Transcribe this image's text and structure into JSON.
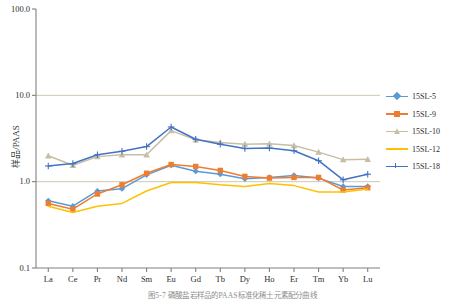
{
  "figure": {
    "caption": "图5-7 磷酸盐岩样品的PAAS标准化稀土元素配分曲线"
  },
  "axes": {
    "y_label": "样品/PAAS",
    "y_ticks": [
      "100.0",
      "10.0",
      "1.0",
      "0.1"
    ],
    "x_ticks": [
      "La",
      "Ce",
      "Pr",
      "Nd",
      "Sm",
      "Eu",
      "Gd",
      "Tb",
      "Dy",
      "Ho",
      "Er",
      "Tm",
      "Yb",
      "Lu"
    ]
  },
  "legend": {
    "items": [
      {
        "label": "15SL-5",
        "color": "#5B9BD5",
        "marker": "diamond"
      },
      {
        "label": "15SL-9",
        "color": "#ED7D31",
        "marker": "square"
      },
      {
        "label": "15SL-10",
        "color": "#C6BFA6",
        "marker": "triangle"
      },
      {
        "label": "15SL-12",
        "color": "#FFC000",
        "marker": "line"
      },
      {
        "label": "15SL-18",
        "color": "#4472C4",
        "marker": "plus"
      }
    ]
  },
  "colors": {
    "axis": "#808080",
    "gridline": "#C9C2A8",
    "plot_background": "#FFFFFF",
    "caption_text": "#8D8D8D"
  },
  "chart_data": {
    "type": "line",
    "title": "",
    "subtitle": "",
    "xlabel": "",
    "ylabel": "样品/PAAS",
    "yscale": "log",
    "ylim": [
      0.1,
      100.0
    ],
    "grid": true,
    "legend_position": "right",
    "categories": [
      "La",
      "Ce",
      "Pr",
      "Nd",
      "Sm",
      "Eu",
      "Gd",
      "Tb",
      "Dy",
      "Ho",
      "Er",
      "Tm",
      "Yb",
      "Lu"
    ],
    "series": [
      {
        "name": "15SL-5",
        "color": "#5B9BD5",
        "values": [
          0.6,
          0.52,
          0.78,
          0.83,
          1.2,
          1.55,
          1.32,
          1.22,
          1.08,
          1.12,
          1.18,
          1.1,
          0.88,
          0.88
        ]
      },
      {
        "name": "15SL-9",
        "color": "#ED7D31",
        "values": [
          0.56,
          0.48,
          0.72,
          0.92,
          1.25,
          1.58,
          1.5,
          1.35,
          1.15,
          1.1,
          1.12,
          1.12,
          0.8,
          0.85
        ]
      },
      {
        "name": "15SL-10",
        "color": "#C6BFA6",
        "values": [
          2.0,
          1.55,
          1.95,
          2.05,
          2.05,
          3.9,
          3.05,
          2.85,
          2.72,
          2.75,
          2.62,
          2.2,
          1.8,
          1.82
        ]
      },
      {
        "name": "15SL-12",
        "color": "#FFC000",
        "values": [
          0.52,
          0.44,
          0.52,
          0.56,
          0.78,
          0.98,
          0.98,
          0.92,
          0.88,
          0.95,
          0.9,
          0.76,
          0.76,
          0.82
        ]
      },
      {
        "name": "15SL-18",
        "color": "#4472C4",
        "values": [
          1.52,
          1.62,
          2.05,
          2.25,
          2.55,
          4.3,
          3.1,
          2.72,
          2.42,
          2.45,
          2.28,
          1.75,
          1.05,
          1.22
        ]
      }
    ]
  }
}
